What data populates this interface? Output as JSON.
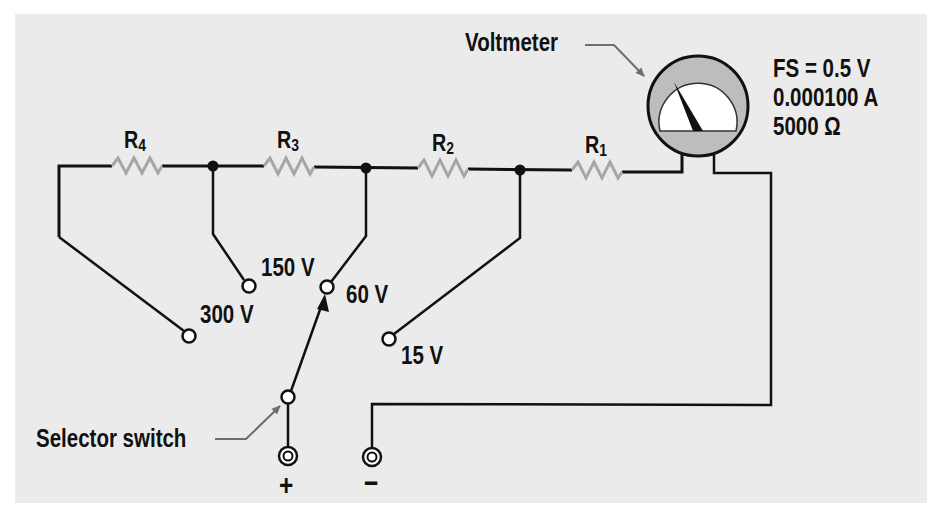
{
  "diagram": {
    "callouts": {
      "voltmeter": "Voltmeter",
      "selector_switch": "Selector switch"
    },
    "meter_specs": {
      "full_scale": "FS = 0.5 V",
      "current": "0.000100 A",
      "resistance": "5000 Ω"
    },
    "resistors": [
      {
        "id": "R4",
        "letter": "R",
        "sub": "4"
      },
      {
        "id": "R3",
        "letter": "R",
        "sub": "3"
      },
      {
        "id": "R2",
        "letter": "R",
        "sub": "2"
      },
      {
        "id": "R1",
        "letter": "R",
        "sub": "1"
      }
    ],
    "ranges": [
      {
        "label": "300 V"
      },
      {
        "label": "150 V"
      },
      {
        "label": "60 V"
      },
      {
        "label": "15 V"
      }
    ],
    "terminals": {
      "positive": "+",
      "negative": "−"
    },
    "selected_range": "60 V",
    "colors": {
      "background": "#ebebeb",
      "wire": "#111111",
      "resistor": "#a6a6a6",
      "meter_bezel": "#bdbdbd",
      "callout_line": "#6e6e6e"
    }
  }
}
